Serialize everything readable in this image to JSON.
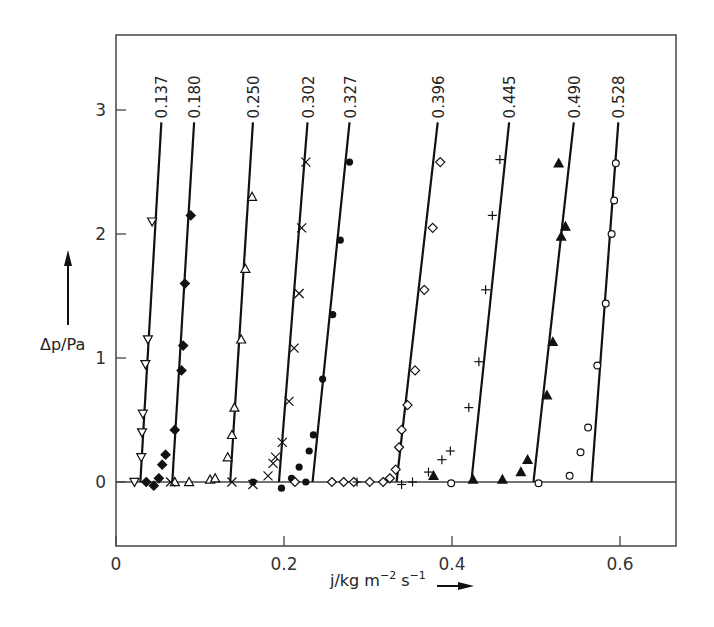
{
  "chart_data": {
    "type": "scatter",
    "title": "",
    "xlabel": "j/kg m^-2 s^-1",
    "ylabel": "Δp/Pa",
    "xlim": [
      0,
      0.666
    ],
    "ylim": [
      -0.52,
      3.6
    ],
    "x_ticks": [
      0,
      0.2,
      0.4,
      0.6
    ],
    "x_tick_labels": [
      "0",
      "0.2",
      "0.4",
      "0.6"
    ],
    "y_ticks": [
      0,
      1,
      2,
      3
    ],
    "y_tick_labels": [
      "0",
      "1",
      "2",
      "3"
    ],
    "grid": false,
    "legend": "inline labels at top of each fitted line",
    "series": [
      {
        "name": "0.137",
        "marker": "triangle-down-open",
        "line": {
          "x0": 0.029,
          "x1": 0.054,
          "y_top": 2.9
        },
        "points": [
          [
            0.022,
            0.0
          ],
          [
            0.03,
            0.2
          ],
          [
            0.031,
            0.4
          ],
          [
            0.032,
            0.55
          ],
          [
            0.035,
            0.95
          ],
          [
            0.038,
            1.15
          ],
          [
            0.043,
            2.1
          ]
        ]
      },
      {
        "name": "0.180",
        "marker": "diamond-filled",
        "line": {
          "x0": 0.067,
          "x1": 0.093,
          "y_top": 2.9
        },
        "points": [
          [
            0.036,
            0.0
          ],
          [
            0.045,
            -0.03
          ],
          [
            0.051,
            0.03
          ],
          [
            0.055,
            0.14
          ],
          [
            0.059,
            0.22
          ],
          [
            0.07,
            0.42
          ],
          [
            0.078,
            0.9
          ],
          [
            0.08,
            1.1
          ],
          [
            0.082,
            1.6
          ],
          [
            0.089,
            2.15
          ]
        ]
      },
      {
        "name": "0.250",
        "marker": "triangle-up-open",
        "line": {
          "x0": 0.136,
          "x1": 0.163,
          "y_top": 2.9
        },
        "points": [
          [
            0.07,
            0.0
          ],
          [
            0.087,
            0.0
          ],
          [
            0.112,
            0.02
          ],
          [
            0.118,
            0.03
          ],
          [
            0.133,
            0.2
          ],
          [
            0.138,
            0.38
          ],
          [
            0.141,
            0.6
          ],
          [
            0.149,
            1.15
          ],
          [
            0.154,
            1.72
          ],
          [
            0.162,
            2.3
          ]
        ]
      },
      {
        "name": "0.302",
        "marker": "cross",
        "line": {
          "x0": 0.194,
          "x1": 0.228,
          "y_top": 2.9
        },
        "points": [
          [
            0.065,
            0.0
          ],
          [
            0.138,
            0.0
          ],
          [
            0.163,
            -0.02
          ],
          [
            0.181,
            0.05
          ],
          [
            0.187,
            0.15
          ],
          [
            0.19,
            0.2
          ],
          [
            0.198,
            0.32
          ],
          [
            0.206,
            0.65
          ],
          [
            0.212,
            1.08
          ],
          [
            0.218,
            1.52
          ],
          [
            0.221,
            2.05
          ],
          [
            0.226,
            2.58
          ]
        ]
      },
      {
        "name": "0.327",
        "marker": "circle-filled",
        "line": {
          "x0": 0.234,
          "x1": 0.278,
          "y_top": 2.9
        },
        "points": [
          [
            0.163,
            0.0
          ],
          [
            0.197,
            -0.05
          ],
          [
            0.209,
            0.03
          ],
          [
            0.218,
            0.12
          ],
          [
            0.226,
            0.0
          ],
          [
            0.23,
            0.25
          ],
          [
            0.235,
            0.38
          ],
          [
            0.246,
            0.83
          ],
          [
            0.258,
            1.35
          ],
          [
            0.267,
            1.95
          ],
          [
            0.278,
            2.58
          ]
        ]
      },
      {
        "name": "0.396",
        "marker": "diamond-open",
        "line": {
          "x0": 0.334,
          "x1": 0.383,
          "y_top": 2.9
        },
        "points": [
          [
            0.213,
            0.0
          ],
          [
            0.257,
            0.0
          ],
          [
            0.271,
            0.0
          ],
          [
            0.283,
            0.0
          ],
          [
            0.302,
            0.0
          ],
          [
            0.318,
            0.0
          ],
          [
            0.326,
            0.03
          ],
          [
            0.333,
            0.1
          ],
          [
            0.337,
            0.28
          ],
          [
            0.34,
            0.42
          ],
          [
            0.347,
            0.62
          ],
          [
            0.356,
            0.9
          ],
          [
            0.367,
            1.55
          ],
          [
            0.377,
            2.05
          ],
          [
            0.386,
            2.58
          ]
        ]
      },
      {
        "name": "0.445",
        "marker": "plus",
        "line": {
          "x0": 0.423,
          "x1": 0.468,
          "y_top": 2.9
        },
        "points": [
          [
            0.287,
            0.0
          ],
          [
            0.34,
            -0.02
          ],
          [
            0.353,
            0.0
          ],
          [
            0.372,
            0.08
          ],
          [
            0.388,
            0.18
          ],
          [
            0.398,
            0.25
          ],
          [
            0.42,
            0.6
          ],
          [
            0.432,
            0.97
          ],
          [
            0.44,
            1.55
          ],
          [
            0.448,
            2.15
          ],
          [
            0.457,
            2.6
          ]
        ]
      },
      {
        "name": "0.490",
        "marker": "triangle-up-filled",
        "line": {
          "x0": 0.497,
          "x1": 0.545,
          "y_top": 2.9
        },
        "points": [
          [
            0.378,
            0.05
          ],
          [
            0.425,
            0.02
          ],
          [
            0.46,
            0.02
          ],
          [
            0.482,
            0.08
          ],
          [
            0.49,
            0.18
          ],
          [
            0.513,
            0.7
          ],
          [
            0.52,
            1.13
          ],
          [
            0.53,
            1.98
          ],
          [
            0.535,
            2.06
          ],
          [
            0.527,
            2.57
          ]
        ]
      },
      {
        "name": "0.528",
        "marker": "circle-open",
        "line": {
          "x0": 0.566,
          "x1": 0.598,
          "y_top": 2.9
        },
        "points": [
          [
            0.399,
            -0.01
          ],
          [
            0.503,
            -0.01
          ],
          [
            0.54,
            0.05
          ],
          [
            0.553,
            0.24
          ],
          [
            0.562,
            0.44
          ],
          [
            0.573,
            0.94
          ],
          [
            0.583,
            1.44
          ],
          [
            0.59,
            2.0
          ],
          [
            0.593,
            2.27
          ],
          [
            0.595,
            2.57
          ]
        ]
      }
    ],
    "annotations": [
      "ylabel arrow up",
      "xlabel arrow right"
    ]
  }
}
